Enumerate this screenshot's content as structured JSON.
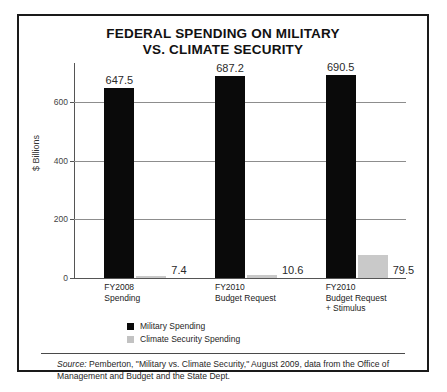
{
  "title": {
    "line1": "FEDERAL SPENDING ON MILITARY",
    "line2": "VS. CLIMATE SECURITY"
  },
  "axis": {
    "ylabel": "$ Billions",
    "yticks": [
      "0",
      "200",
      "400",
      "600"
    ]
  },
  "legend": {
    "military_label": "Military Spending",
    "climate_label": "Climate Security Spending"
  },
  "source": {
    "prefix": "Source:",
    "text": " Pemberton, \"Military vs. Climate Security,\" August 2009, data from the Office of Management and Budget and the State Dept."
  },
  "categories": [
    {
      "line1": "FY2008",
      "line2": "Spending",
      "line3": ""
    },
    {
      "line1": "FY2010",
      "line2": "Budget Request",
      "line3": ""
    },
    {
      "line1": "FY2010",
      "line2": "Budget Request",
      "line3": "+ Stimulus"
    }
  ],
  "values": {
    "military": [
      "647.5",
      "687.2",
      "690.5"
    ],
    "climate": [
      "7.4",
      "10.6",
      "79.5"
    ]
  },
  "colors": {
    "military": "#0a0a0a",
    "climate": "#c9c9c9",
    "frame": "#1a1a1a",
    "grid": "#8d8d8d"
  },
  "chart_data": {
    "type": "bar",
    "title": "FEDERAL SPENDING ON MILITARY VS. CLIMATE SECURITY",
    "xlabel": "",
    "ylabel": "$ Billions",
    "ylim": [
      0,
      732
    ],
    "yticks": [
      0,
      200,
      400,
      600
    ],
    "grid": true,
    "legend_position": "below-plot-left",
    "categories": [
      "FY2008 Spending",
      "FY2010 Budget Request",
      "FY2010 Budget Request + Stimulus"
    ],
    "series": [
      {
        "name": "Military Spending",
        "color": "#0a0a0a",
        "values": [
          647.5,
          687.2,
          690.5
        ]
      },
      {
        "name": "Climate Security Spending",
        "color": "#c9c9c9",
        "values": [
          7.4,
          10.6,
          79.5
        ]
      }
    ],
    "annotations": [
      "Source: Pemberton, \"Military vs. Climate Security,\" August 2009, data from the Office of Management and Budget and the State Dept."
    ]
  }
}
